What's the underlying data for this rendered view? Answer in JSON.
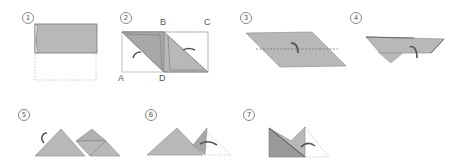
{
  "diagram": {
    "type": "origami-folding-instructions",
    "colors": {
      "paper": "#b8b8b8",
      "paper_dark": "#a4a4a4",
      "edge": "#777777",
      "arrow": "#555555",
      "dashed": "#bbbbbb"
    },
    "steps": [
      {
        "number": "1",
        "description": "Rectangle folded in half, top half shaded, dashed outline below"
      },
      {
        "number": "2",
        "description": "Parallelogram fold with corner labels",
        "labels": {
          "A": "A",
          "B": "B",
          "C": "C",
          "D": "D"
        }
      },
      {
        "number": "3",
        "description": "Parallelogram with horizontal dashed fold line and fold arrow"
      },
      {
        "number": "4",
        "description": "Folded trapezoid with triangle below and arrow"
      },
      {
        "number": "5",
        "description": "Two triangles with rotation arrow"
      },
      {
        "number": "6",
        "description": "Triangle with folded flap and arrow, dashed outline"
      },
      {
        "number": "7",
        "description": "Folded shape with arrow and dashed outline"
      }
    ]
  }
}
